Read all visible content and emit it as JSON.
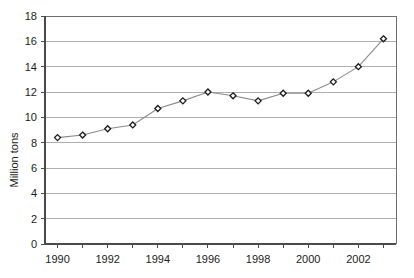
{
  "chart_data": {
    "type": "line",
    "title": "",
    "xlabel": "",
    "ylabel": "Million tons",
    "x": [
      1990,
      1991,
      1992,
      1993,
      1994,
      1995,
      1996,
      1997,
      1998,
      1999,
      2000,
      2001,
      2002,
      2003
    ],
    "values": [
      8.4,
      8.6,
      9.1,
      9.4,
      10.7,
      11.3,
      12.0,
      11.7,
      11.3,
      11.9,
      11.9,
      12.8,
      14.0,
      16.2
    ],
    "series": [
      {
        "name": "Million tons",
        "values": [
          8.4,
          8.6,
          9.1,
          9.4,
          10.7,
          11.3,
          12.0,
          11.7,
          11.3,
          11.9,
          11.9,
          12.8,
          14.0,
          16.2
        ]
      }
    ],
    "ylim": [
      0,
      18
    ],
    "ytick_labels": [
      "0",
      "2",
      "4",
      "6",
      "8",
      "10",
      "12",
      "14",
      "16",
      "18"
    ],
    "ytick_values": [
      0,
      2,
      4,
      6,
      8,
      10,
      12,
      14,
      16,
      18
    ],
    "xtick_labels": [
      "1990",
      "1992",
      "1994",
      "1996",
      "1998",
      "2000",
      "2002"
    ],
    "xtick_values": [
      1990,
      1992,
      1994,
      1996,
      1998,
      2000,
      2002
    ],
    "xlim": [
      1989.5,
      2003.5
    ],
    "grid": "horizontal",
    "legend": "none",
    "marker": "diamond",
    "colors": {
      "line": "#8a8a8a",
      "marker_fill": "#ffffff",
      "marker_stroke": "#1a1a1a",
      "gridline": "#9a9a9a",
      "axis": "#4a4a4a",
      "text": "#1a1a1a",
      "background": "#ffffff"
    }
  }
}
